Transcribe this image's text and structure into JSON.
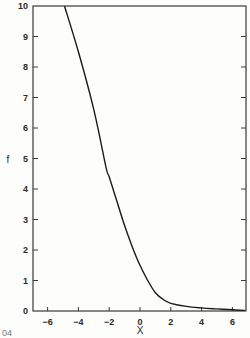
{
  "chart_data": {
    "type": "line",
    "title": "",
    "xlabel": "X",
    "ylabel": "f",
    "xlim": [
      -7,
      6.8
    ],
    "ylim": [
      0,
      10
    ],
    "x_ticks": [
      -6,
      -4,
      -2,
      0,
      2,
      4,
      6
    ],
    "y_ticks": [
      0,
      1,
      2,
      3,
      4,
      5,
      6,
      7,
      8,
      9,
      10
    ],
    "grid": false,
    "legend": null,
    "series": [
      {
        "name": "f",
        "x": [
          -4.9,
          -4,
          -3,
          -2.2,
          -2,
          -1.5,
          -1,
          -0.5,
          0,
          0.5,
          1,
          1.5,
          2,
          3,
          4,
          5,
          6,
          6.8
        ],
        "y": [
          10,
          8.5,
          6.6,
          4.7,
          4.4,
          3.6,
          2.8,
          2.1,
          1.5,
          1.0,
          0.6,
          0.38,
          0.25,
          0.15,
          0.1,
          0.07,
          0.04,
          0.02
        ]
      }
    ],
    "annotations": [
      "04"
    ]
  },
  "labels": {
    "xlabel": "X",
    "ylabel": "f",
    "corner": "04",
    "x_ticks": [
      "-6",
      "-4",
      "-2",
      "0",
      "2",
      "4",
      "6"
    ],
    "y_ticks": [
      "0",
      "1",
      "2",
      "3",
      "4",
      "5",
      "6",
      "7",
      "8",
      "9",
      "10"
    ]
  }
}
